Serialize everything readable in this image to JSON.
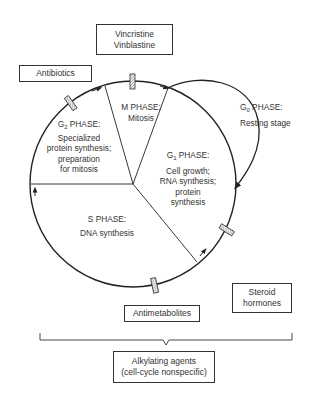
{
  "diagram": {
    "phases": [
      {
        "id": "m",
        "name": "M PHASE:",
        "lines": [
          "Mitosis"
        ]
      },
      {
        "id": "g2",
        "name_prefix": "G",
        "name_sub": "2",
        "name_suffix": " PHASE:",
        "lines": [
          "Specialized",
          "protein synthesis;",
          "preparation",
          "for mitosis"
        ]
      },
      {
        "id": "g1",
        "name_prefix": "G",
        "name_sub": "1",
        "name_suffix": " PHASE:",
        "lines": [
          "Cell growth;",
          "RNA synthesis;",
          "protein",
          "synthesis"
        ]
      },
      {
        "id": "s",
        "name": "S PHASE:",
        "lines": [
          "DNA synthesis"
        ]
      },
      {
        "id": "g0",
        "name_prefix": "G",
        "name_sub": "0",
        "name_suffix": " PHASE:",
        "lines": [
          "Resting stage"
        ]
      }
    ],
    "agents": [
      {
        "id": "vinca",
        "lines": [
          "Vincristine",
          "Vinblastine"
        ],
        "target": "M phase"
      },
      {
        "id": "antibiotics",
        "lines": [
          "Antibiotics"
        ],
        "target": "G2 phase"
      },
      {
        "id": "steroids",
        "lines": [
          "Steroid",
          "hormones"
        ],
        "target": "G1 phase"
      },
      {
        "id": "antimetabolites",
        "lines": [
          "Antimetabolites"
        ],
        "target": "S phase"
      },
      {
        "id": "alkylating",
        "lines": [
          "Alkylating agents",
          "(cell-cycle nonspecific)"
        ],
        "target": "all phases"
      }
    ],
    "colors": {
      "line": "#222222",
      "text": "#333333",
      "background": "#ffffff",
      "marker_fill": "#dddddd"
    }
  }
}
